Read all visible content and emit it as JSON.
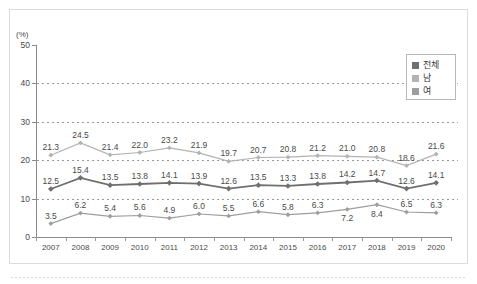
{
  "chart_data": {
    "type": "line",
    "title": "",
    "subtitle": "",
    "xlabel": "",
    "ylabel": "",
    "unit_label": "(%)",
    "categories": [
      "2007",
      "2008",
      "2009",
      "2010",
      "2011",
      "2012",
      "2013",
      "2014",
      "2015",
      "2016",
      "2017",
      "2018",
      "2019",
      "2020"
    ],
    "ylim": [
      0,
      50
    ],
    "yticks": [
      0,
      10,
      20,
      30,
      40,
      50
    ],
    "grid": true,
    "grid_axis": "y",
    "legend_position": "top-right",
    "series": [
      {
        "name": "전체",
        "color": "#6f6f6f",
        "values": [
          12.5,
          15.4,
          13.5,
          13.8,
          14.1,
          13.9,
          12.6,
          13.5,
          13.3,
          13.8,
          14.2,
          14.7,
          12.6,
          14.1
        ],
        "label_positions": [
          "above",
          "above",
          "above",
          "above",
          "above",
          "above",
          "above",
          "above",
          "above",
          "above",
          "above",
          "above",
          "above",
          "above"
        ]
      },
      {
        "name": "남",
        "color": "#b3b3b3",
        "values": [
          21.3,
          24.5,
          21.4,
          22.0,
          23.2,
          21.9,
          19.7,
          20.7,
          20.8,
          21.2,
          21.0,
          20.8,
          18.6,
          21.6
        ],
        "label_positions": [
          "above",
          "above",
          "above",
          "above",
          "above",
          "above",
          "above",
          "above",
          "above",
          "above",
          "above",
          "above",
          "above",
          "above"
        ]
      },
      {
        "name": "여",
        "color": "#9e9e9e",
        "values": [
          3.5,
          6.2,
          5.4,
          5.6,
          4.9,
          6.0,
          5.5,
          6.6,
          5.8,
          6.3,
          7.2,
          8.4,
          6.5,
          6.3
        ],
        "label_positions": [
          "above",
          "above",
          "above",
          "above",
          "above",
          "above",
          "above",
          "above",
          "above",
          "above",
          "below",
          "below",
          "above",
          "above"
        ]
      }
    ]
  },
  "legend": {
    "items": [
      {
        "label": "전체",
        "color": "#6f6f6f"
      },
      {
        "label": "남",
        "color": "#b3b3b3"
      },
      {
        "label": "여",
        "color": "#9e9e9e"
      }
    ]
  }
}
